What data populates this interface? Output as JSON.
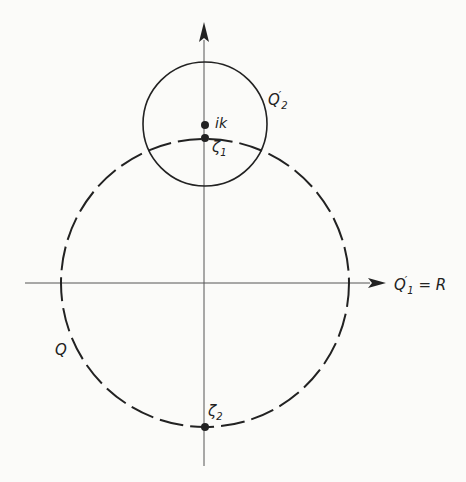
{
  "diagram": {
    "axes": {
      "origin": [
        204,
        283
      ],
      "x_axis_label": "Q'1 = R",
      "y_axis_arrow": true
    },
    "circles": [
      {
        "name": "Q",
        "style": "dashed",
        "center": [
          205,
          283
        ],
        "radius": 144
      },
      {
        "name": "Q'2",
        "style": "solid",
        "center": [
          205,
          124
        ],
        "radius": 62
      }
    ],
    "points": [
      {
        "label": "ik",
        "position": [
          205,
          124
        ]
      },
      {
        "label": "ζ1",
        "position": [
          205,
          138
        ]
      },
      {
        "label": "ζ2",
        "position": [
          205,
          427
        ]
      }
    ]
  },
  "labels": {
    "q": "Q",
    "q2_main": "Q",
    "q2_prime": "′",
    "q2_sub": "2",
    "ik": "ik",
    "zeta1_main": "ζ",
    "zeta1_sub": "1",
    "zeta2_main": "ζ",
    "zeta2_sub": "2",
    "axis_main": "Q",
    "axis_prime": "′",
    "axis_sub": "1",
    "axis_rest": " = R"
  },
  "colors": {
    "ink": "#222222",
    "axis": "#555555",
    "background": "#fbfbf9"
  }
}
